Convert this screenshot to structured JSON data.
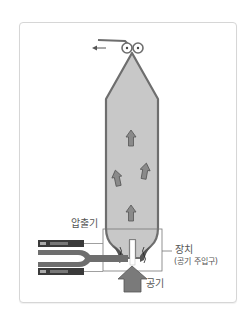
{
  "diagram": {
    "type": "blown-film-extrusion",
    "colors": {
      "film_fill": "#c8c8c8",
      "film_stroke": "#6e6e6e",
      "arrow_fill": "#8a8a8a",
      "arrow_stroke": "#555555",
      "die_dark": "#3a3a3a",
      "frame_border": "#d6d6d6",
      "label_color": "#555555"
    },
    "labels": {
      "extruder": "압출기",
      "device": "장치",
      "device_sub": "(공기 주입구)",
      "air": "공기"
    },
    "icons": {
      "take_off_arrow": "arrow-left-icon",
      "nip_rollers": "roller-icon",
      "air_flow_arrows": "arrow-up-icon"
    }
  }
}
